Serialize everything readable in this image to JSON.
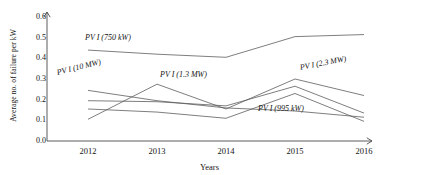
{
  "chart_data": {
    "type": "line",
    "title": "",
    "xlabel": "Years",
    "ylabel": "Average no. of  failure per kW",
    "categories": [
      "2012",
      "2013",
      "2014",
      "2015",
      "2016"
    ],
    "x": [
      2012,
      2013,
      2014,
      2015,
      2016
    ],
    "xlim": [
      2011.7,
      2016.3
    ],
    "ylim": [
      0.0,
      0.6
    ],
    "yticks": [
      "0.0",
      "0.1",
      "0.2",
      "0.3",
      "0.4",
      "0.5",
      "0.6"
    ],
    "ytick_values": [
      0.0,
      0.1,
      0.2,
      0.3,
      0.4,
      0.5,
      0.6
    ],
    "grid": false,
    "legend": "inline-annotations",
    "line_color": "#5d5d5d",
    "axis_color": "#4a4a4a",
    "series": [
      {
        "name": "PV I (750 kW)",
        "values": [
          0.44,
          0.42,
          0.405,
          0.505,
          0.515
        ]
      },
      {
        "name": "PV I (10 MW)",
        "values": [
          0.245,
          0.195,
          0.16,
          0.145,
          0.115
        ]
      },
      {
        "name": "PV I (1.3 MW)",
        "values": [
          0.105,
          0.275,
          0.155,
          0.3,
          0.22
        ]
      },
      {
        "name": "PV I (2.3 MW)",
        "values": [
          0.195,
          0.19,
          0.17,
          0.265,
          0.135
        ]
      },
      {
        "name": "PV I (995 kW)",
        "values": [
          0.155,
          0.14,
          0.11,
          0.23,
          0.095
        ]
      }
    ],
    "annotations": [
      {
        "text": "PV I (750 kW)",
        "series": "PV I (750 kW)",
        "x": 85,
        "y": 33,
        "rotate": 0,
        "italic": true
      },
      {
        "text": "PV I (10 MW)",
        "series": "PV I (10 MW)",
        "x": 57,
        "y": 68,
        "rotate": -14,
        "italic": true
      },
      {
        "text": "PV I (1.3 MW)",
        "series": "PV I (1.3 MW)",
        "x": 160,
        "y": 70,
        "rotate": 0,
        "italic": true
      },
      {
        "text": "PV I (2.3 MW)",
        "series": "PV I (2.3 MW)",
        "x": 300,
        "y": 63,
        "rotate": -11,
        "italic": true
      },
      {
        "text": "PV I (995 kW)",
        "series": "PV I (995 kW)",
        "x": 258,
        "y": 104,
        "rotate": 0,
        "italic": true
      }
    ]
  }
}
